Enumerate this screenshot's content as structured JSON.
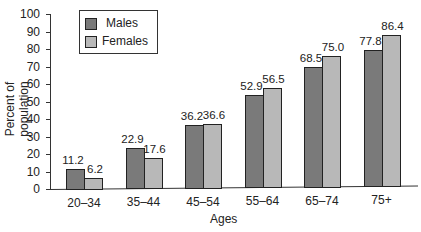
{
  "chart_data": {
    "type": "bar",
    "title": "",
    "xlabel": "Ages",
    "ylabel": "Percent of population",
    "ylim": [
      0,
      100
    ],
    "yticks": [
      "0",
      "10",
      "20",
      "30",
      "40",
      "50",
      "60",
      "70",
      "80",
      "90",
      "100"
    ],
    "grid": false,
    "legend_position": "upper-left",
    "categories": [
      "20–34",
      "35–44",
      "45–54",
      "55–64",
      "65–74",
      "75+"
    ],
    "series": [
      {
        "name": "Males",
        "color": "#7a7a7a",
        "values": [
          11.2,
          22.9,
          36.2,
          52.9,
          68.5,
          77.8
        ],
        "labels": [
          "11.2",
          "22.9",
          "36.2",
          "52.9",
          "68.5",
          "77.8"
        ]
      },
      {
        "name": "Females",
        "color": "#b8b8b8",
        "values": [
          6.2,
          17.6,
          36.6,
          56.5,
          75.0,
          86.4
        ],
        "labels": [
          "6.2",
          "17.6",
          "36.6",
          "56.5",
          "75.0",
          "86.4"
        ]
      }
    ]
  }
}
